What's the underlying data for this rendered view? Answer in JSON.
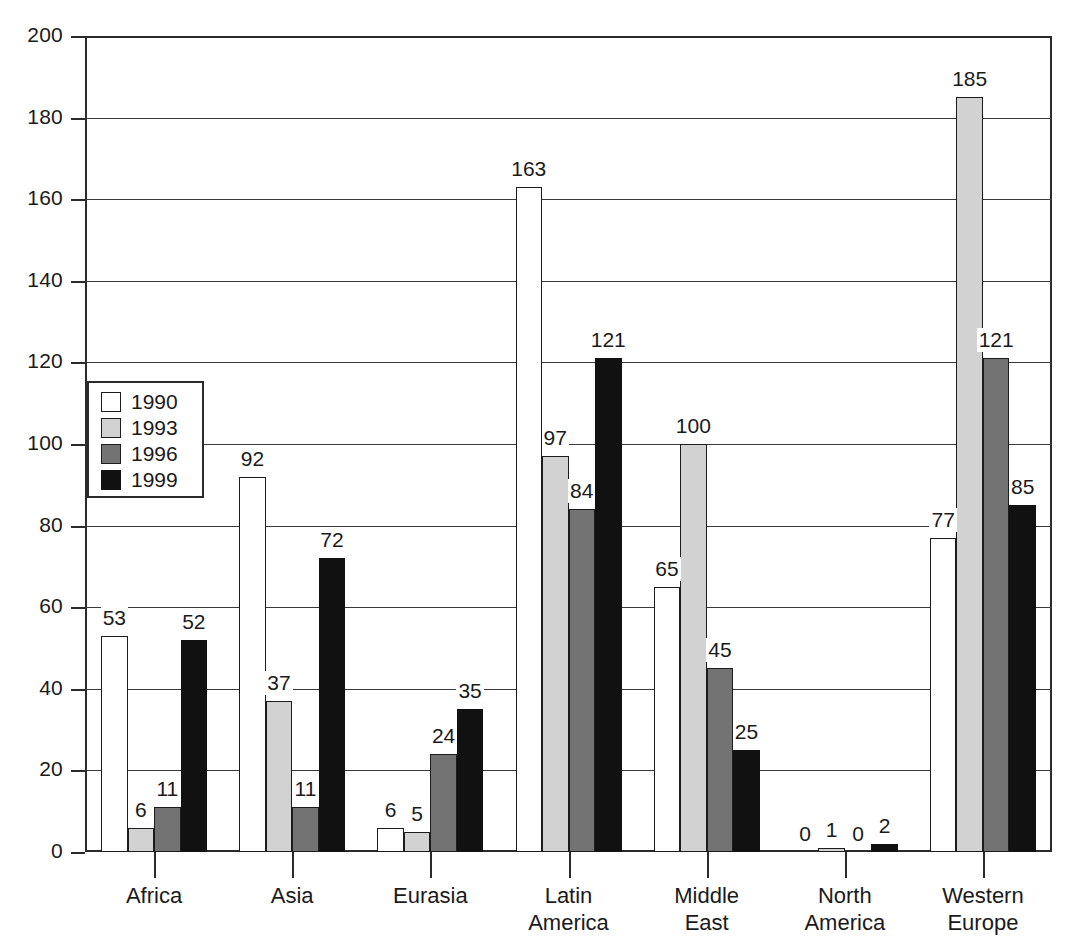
{
  "chart_data": {
    "type": "bar",
    "title": "",
    "subtitle": "",
    "xlabel": "",
    "ylabel": "",
    "ylim": [
      0,
      200
    ],
    "ytick_labels": [
      "0",
      "20",
      "40",
      "60",
      "80",
      "100",
      "120",
      "140",
      "160",
      "180",
      "200"
    ],
    "ytick_values": [
      0,
      20,
      40,
      60,
      80,
      100,
      120,
      140,
      160,
      180,
      200
    ],
    "grid": true,
    "grid_axis": "y",
    "legend_position": "upper-left-inside",
    "categories": [
      "Africa",
      "Asia",
      "Eurasia",
      "Latin America",
      "Middle East",
      "North America",
      "Western Europe"
    ],
    "category_label_lines": [
      [
        "Africa"
      ],
      [
        "Asia"
      ],
      [
        "Eurasia"
      ],
      [
        "Latin",
        "America"
      ],
      [
        "Middle",
        "East"
      ],
      [
        "North",
        "America"
      ],
      [
        "Western",
        "Europe"
      ]
    ],
    "series": [
      {
        "name": "1990",
        "color": "#ffffff",
        "values": [
          53,
          92,
          6,
          163,
          65,
          0,
          77
        ]
      },
      {
        "name": "1993",
        "color": "#d2d2d2",
        "values": [
          6,
          37,
          5,
          97,
          100,
          1,
          185
        ]
      },
      {
        "name": "1996",
        "color": "#737373",
        "values": [
          11,
          11,
          24,
          84,
          45,
          0,
          121
        ]
      },
      {
        "name": "1999",
        "color": "#111111",
        "values": [
          52,
          72,
          35,
          121,
          25,
          2,
          85
        ]
      }
    ],
    "show_value_labels": true,
    "bar_edge_color": "#1c1c1c",
    "axis_color": "#2b2b2b"
  },
  "legend": {
    "entries": [
      {
        "label": "1990",
        "swatch": "s1990"
      },
      {
        "label": "1993",
        "swatch": "s1993"
      },
      {
        "label": "1996",
        "swatch": "s1996"
      },
      {
        "label": "1999",
        "swatch": "s1999"
      }
    ]
  }
}
